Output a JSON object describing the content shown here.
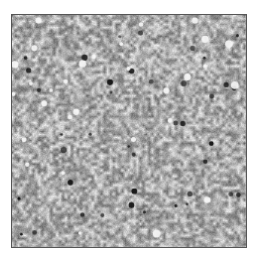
{
  "image": {
    "description": "Grayscale speckle noise texture inside a thin dark square frame",
    "frame_color": "#555555",
    "base_gray": "#a8a8a8",
    "light_speck": "#f2f2f2",
    "dark_speck": "#1a1a1a",
    "width": 236,
    "height": 234
  }
}
